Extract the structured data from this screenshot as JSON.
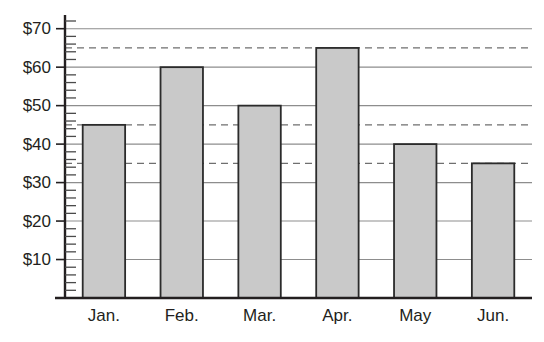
{
  "chart_data": {
    "type": "bar",
    "title": "",
    "subtitle": "",
    "xlabel": "",
    "ylabel": "",
    "categories": [
      "Jan.",
      "Feb.",
      "Mar.",
      "Apr.",
      "May",
      "Jun."
    ],
    "values": [
      45,
      60,
      50,
      65,
      40,
      35
    ],
    "value_prefix": "$",
    "ylim": [
      0,
      72
    ],
    "ytick_values": [
      10,
      20,
      30,
      40,
      50,
      60,
      70
    ],
    "ytick_labels": [
      "$10",
      "$20",
      "$30",
      "$40",
      "$50",
      "$60",
      "$70"
    ],
    "yminor_step": 2,
    "grid": true,
    "grid_axis": "y",
    "legend": null,
    "annotations": [
      {
        "type": "reference-line",
        "style": "dashed",
        "value": 65,
        "label": ""
      },
      {
        "type": "reference-line",
        "style": "dashed",
        "value": 45,
        "label": ""
      },
      {
        "type": "reference-line",
        "style": "dashed",
        "value": 35,
        "label": ""
      }
    ],
    "colors": {
      "bar_fill": "#c9c9c9",
      "bar_stroke": "#2b2b2b",
      "gridline": "#8d8d8d",
      "dashed_line": "#6f6f6f",
      "axis": "#231f20",
      "text": "#231f20",
      "background": "#ffffff"
    }
  }
}
